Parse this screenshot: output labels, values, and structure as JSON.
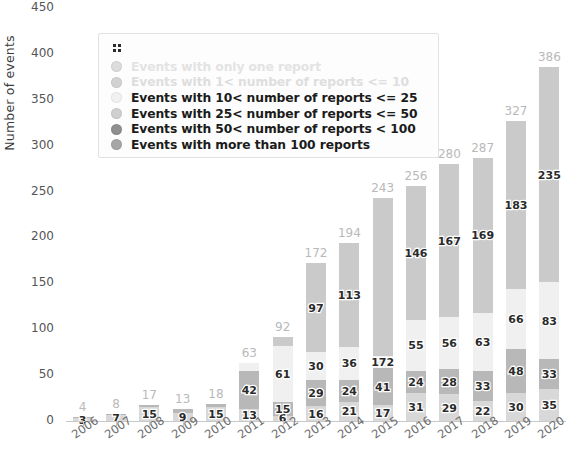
{
  "chart_data": {
    "type": "bar",
    "stacked": true,
    "title": "",
    "xlabel": "",
    "ylabel": "Number of events",
    "ylim": [
      0,
      450
    ],
    "yticks": [
      0,
      50,
      100,
      150,
      200,
      250,
      300,
      350,
      400,
      450
    ],
    "grid": false,
    "legend_position": "upper left (floating box)",
    "categories": [
      "2006",
      "2007",
      "2008",
      "2009",
      "2010",
      "2011",
      "2012",
      "2013",
      "2014",
      "2015",
      "2016",
      "2017",
      "2018",
      "2019",
      "2020"
    ],
    "series": [
      {
        "name": "Events with only one report",
        "color": "#d8d8d8",
        "values": [
          3,
          7,
          15,
          9,
          15,
          13,
          6,
          16,
          21,
          17,
          31,
          29,
          22,
          30,
          35
        ]
      },
      {
        "name": "Events with 1< number of reports <= 10",
        "color": "#b8b8b8",
        "values": [
          1,
          1,
          2,
          4,
          3,
          42,
          15,
          29,
          24,
          41,
          24,
          28,
          33,
          48,
          33
        ]
      },
      {
        "name": "Events with 10< number of reports <= 25",
        "color": "#f0f0f0",
        "values": [
          0,
          0,
          0,
          0,
          0,
          8,
          61,
          30,
          36,
          13,
          55,
          56,
          63,
          66,
          83
        ]
      },
      {
        "name": "Events with 25< number of reports <= 50",
        "color": "#cacaca",
        "values": [
          0,
          0,
          0,
          0,
          0,
          0,
          10,
          97,
          113,
          172,
          146,
          167,
          169,
          183,
          235
        ]
      },
      {
        "name": "Events with 50< number of reports < 100",
        "color": "#9a9a9a",
        "values": [
          0,
          0,
          0,
          0,
          0,
          0,
          0,
          0,
          0,
          0,
          0,
          0,
          0,
          0,
          0
        ]
      },
      {
        "name": "Events with more than 100 reports",
        "color": "#8e8e8e",
        "values": [
          0,
          0,
          0,
          0,
          0,
          0,
          0,
          0,
          0,
          0,
          0,
          0,
          0,
          0,
          0
        ]
      }
    ],
    "totals": [
      4,
      8,
      17,
      13,
      18,
      63,
      92,
      172,
      194,
      243,
      256,
      280,
      287,
      327,
      386
    ],
    "segment_labels": {
      "2006": [
        "3"
      ],
      "2007": [
        "7"
      ],
      "2008": [
        "15"
      ],
      "2009": [
        "9"
      ],
      "2010": [
        "15"
      ],
      "2011": [
        "13",
        "42"
      ],
      "2012": [
        "6",
        "15",
        "61"
      ],
      "2013": [
        "16",
        "29",
        "30",
        "97"
      ],
      "2014": [
        "21",
        "24",
        "36",
        "113"
      ],
      "2015": [
        "17",
        "41",
        "172"
      ],
      "2016": [
        "31",
        "24",
        "55",
        "146"
      ],
      "2017": [
        "29",
        "28",
        "56",
        "167"
      ],
      "2018": [
        "22",
        "33",
        "63",
        "169"
      ],
      "2019": [
        "30",
        "48",
        "66",
        "183"
      ],
      "2020": [
        "35",
        "33",
        "83",
        "235"
      ]
    }
  },
  "legend": {
    "handle_icon": "drag-handle-icon",
    "items": [
      {
        "label": "Events with only one report",
        "color": "#dcdcdc",
        "faded": true
      },
      {
        "label": "Events with 1< number of reports <= 10",
        "color": "#d2d2d2",
        "faded": true
      },
      {
        "label": "Events with 10< number of reports <= 25",
        "color": "#f1f1f1",
        "faded": false
      },
      {
        "label": "Events with 25< number of reports <= 50",
        "color": "#cfcfcf",
        "faded": false
      },
      {
        "label": "Events with 50< number of reports < 100",
        "color": "#8f8f8f",
        "faded": false
      },
      {
        "label": "Events with more than 100 reports",
        "color": "#a6a6a6",
        "faded": false
      }
    ]
  }
}
